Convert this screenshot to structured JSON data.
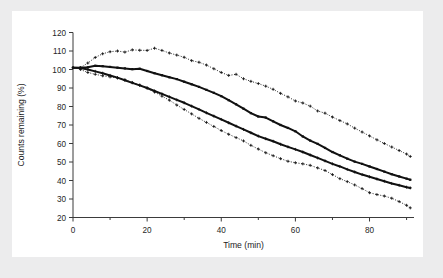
{
  "figure": {
    "background_color": "#ececed",
    "card_color": "#ffffff"
  },
  "chart_data": {
    "type": "line",
    "title": "",
    "xlabel": "Time (min)",
    "ylabel": "Counts remaining (%)",
    "xlim": [
      0,
      92
    ],
    "ylim": [
      20,
      120
    ],
    "xticks": [
      0,
      20,
      40,
      60,
      80
    ],
    "xticklabels": [
      "0",
      "20",
      "40",
      "60",
      "80"
    ],
    "xminorticks": [
      10,
      30,
      50,
      70,
      90
    ],
    "yticks": [
      20,
      30,
      40,
      50,
      60,
      70,
      80,
      90,
      100,
      110,
      120
    ],
    "yticklabels": [
      "20",
      "30",
      "40",
      "50",
      "60",
      "70",
      "80",
      "90",
      "100",
      "110",
      "120"
    ],
    "grid": false,
    "legend": "none",
    "frame": "left-bottom-spines",
    "series": [
      {
        "name": "upper-dotted",
        "style": "dotted",
        "marker": "plus",
        "color": "#1a1a1a",
        "x": [
          2,
          4,
          6,
          8,
          10,
          12,
          14,
          16,
          18,
          20,
          22,
          24,
          26,
          28,
          30,
          32,
          34,
          36,
          38,
          40,
          42,
          44,
          46,
          48,
          50,
          52,
          54,
          56,
          58,
          60,
          62,
          64,
          66,
          68,
          70,
          72,
          74,
          76,
          78,
          80,
          82,
          84,
          86,
          88,
          90,
          91
        ],
        "y": [
          101.0,
          103.5,
          106.5,
          108.5,
          109.6,
          110.0,
          109.4,
          110.6,
          110.4,
          110.3,
          111.5,
          110.3,
          108.9,
          107.8,
          106.6,
          104.8,
          103.9,
          102.4,
          100.4,
          98.4,
          96.8,
          97.4,
          95.0,
          93.6,
          92.4,
          91.0,
          89.3,
          87.1,
          85.2,
          83.0,
          81.9,
          80.2,
          77.6,
          76.4,
          74.3,
          72.4,
          70.6,
          68.3,
          66.2,
          64.1,
          62.0,
          60.0,
          58.1,
          56.2,
          54.3,
          53.0
        ]
      },
      {
        "name": "upper-solid",
        "style": "solid",
        "marker": "square",
        "color": "#111111",
        "x": [
          0,
          2,
          4,
          6,
          8,
          10,
          12,
          14,
          16,
          18,
          20,
          22,
          24,
          26,
          28,
          30,
          32,
          34,
          36,
          38,
          40,
          42,
          44,
          46,
          48,
          50,
          52,
          54,
          56,
          58,
          60,
          62,
          64,
          66,
          68,
          70,
          72,
          74,
          76,
          78,
          80,
          82,
          84,
          86,
          88,
          90,
          91
        ],
        "y": [
          101.0,
          101.0,
          101.2,
          102.0,
          101.8,
          101.4,
          101.0,
          100.6,
          100.2,
          100.4,
          99.2,
          98.0,
          96.9,
          95.8,
          94.8,
          93.4,
          92.0,
          90.6,
          89.0,
          87.4,
          85.6,
          83.4,
          81.2,
          78.8,
          76.4,
          74.6,
          74.0,
          72.0,
          70.0,
          68.4,
          66.6,
          63.8,
          61.6,
          59.8,
          57.6,
          55.4,
          53.6,
          51.8,
          50.2,
          49.0,
          47.6,
          46.2,
          44.8,
          43.4,
          42.2,
          41.0,
          40.4
        ]
      },
      {
        "name": "lower-solid",
        "style": "solid",
        "marker": "plus",
        "color": "#111111",
        "x": [
          0,
          2,
          4,
          6,
          8,
          10,
          12,
          14,
          16,
          18,
          20,
          22,
          24,
          26,
          28,
          30,
          32,
          34,
          36,
          38,
          40,
          42,
          44,
          46,
          48,
          50,
          52,
          54,
          56,
          58,
          60,
          62,
          64,
          66,
          68,
          70,
          72,
          74,
          76,
          78,
          80,
          82,
          84,
          86,
          88,
          90,
          91
        ],
        "y": [
          101.0,
          100.8,
          100.0,
          99.0,
          98.0,
          96.8,
          95.6,
          94.2,
          92.8,
          91.4,
          90.0,
          88.4,
          86.8,
          85.2,
          83.6,
          82.0,
          80.2,
          78.4,
          76.6,
          74.8,
          73.0,
          71.2,
          69.4,
          67.6,
          65.8,
          64.0,
          62.6,
          61.2,
          59.6,
          58.2,
          56.8,
          55.4,
          53.8,
          52.2,
          50.6,
          49.0,
          47.6,
          46.0,
          44.6,
          43.2,
          42.0,
          40.8,
          39.6,
          38.4,
          37.4,
          36.4,
          36.0
        ]
      },
      {
        "name": "lower-dotted",
        "style": "dotted",
        "marker": "plus",
        "color": "#1a1a1a",
        "x": [
          2,
          4,
          6,
          8,
          10,
          12,
          14,
          16,
          18,
          20,
          22,
          24,
          26,
          28,
          30,
          32,
          34,
          36,
          38,
          40,
          42,
          44,
          46,
          48,
          50,
          52,
          54,
          56,
          58,
          60,
          62,
          64,
          66,
          68,
          70,
          72,
          74,
          76,
          78,
          80,
          82,
          84,
          86,
          88,
          90,
          91
        ],
        "y": [
          100.0,
          98.4,
          97.4,
          96.6,
          96.0,
          95.4,
          94.4,
          93.0,
          91.6,
          90.0,
          87.8,
          85.6,
          83.4,
          80.8,
          78.4,
          76.0,
          73.6,
          71.4,
          69.2,
          67.0,
          65.0,
          63.2,
          61.4,
          59.0,
          57.0,
          55.0,
          53.4,
          51.8,
          50.4,
          49.6,
          49.0,
          48.2,
          46.8,
          45.4,
          43.2,
          41.0,
          39.4,
          37.6,
          35.6,
          33.4,
          32.4,
          31.6,
          30.4,
          28.6,
          26.6,
          25.2
        ]
      }
    ]
  }
}
